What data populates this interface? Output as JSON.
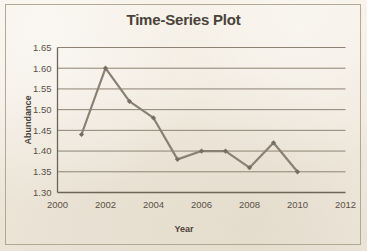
{
  "chart_data": {
    "type": "line",
    "title": "Time-Series Plot",
    "xlabel": "Year",
    "ylabel": "Abundance",
    "xlim": [
      2000,
      2012
    ],
    "ylim": [
      1.3,
      1.65
    ],
    "grid": "horizontal",
    "legend": "none",
    "x": [
      2001,
      2002,
      2003,
      2004,
      2005,
      2006,
      2007,
      2008,
      2009,
      2010
    ],
    "values": [
      1.44,
      1.6,
      1.52,
      1.48,
      1.38,
      1.4,
      1.4,
      1.36,
      1.42,
      1.35
    ],
    "series": [
      {
        "name": "Abundance",
        "x": [
          2001,
          2002,
          2003,
          2004,
          2005,
          2006,
          2007,
          2008,
          2009,
          2010
        ],
        "values": [
          1.44,
          1.6,
          1.52,
          1.48,
          1.38,
          1.4,
          1.4,
          1.36,
          1.42,
          1.35
        ],
        "color": "#8a8073",
        "marker": "diamond"
      }
    ],
    "x_tick_labels": [
      "2000",
      "2002",
      "2004",
      "2006",
      "2008",
      "2010",
      "2012"
    ],
    "x_ticks": [
      2000,
      2002,
      2004,
      2006,
      2008,
      2010,
      2012
    ],
    "y_tick_labels": [
      "1.65",
      "1.60",
      "1.55",
      "1.50",
      "1.45",
      "1.40",
      "1.35",
      "1.30"
    ],
    "y_ticks": [
      1.65,
      1.6,
      1.55,
      1.5,
      1.45,
      1.4,
      1.35,
      1.3
    ],
    "colors": {
      "background": "#f2ece1",
      "series": "#8a8073",
      "marker": "#776d60",
      "gridline": "#8d8374",
      "axis": "#6e6557",
      "text": "#4a4239"
    }
  }
}
